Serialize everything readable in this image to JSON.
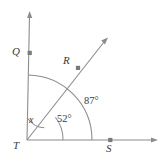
{
  "figure": {
    "background_color": "#ffffff",
    "line_color": "#8c8c8c",
    "label_color": "#3a3a3a",
    "points": [
      {
        "id": "Q",
        "label": "Q",
        "x": 30,
        "y": 53
      },
      {
        "id": "R",
        "label": "R",
        "x": 78,
        "y": 68
      },
      {
        "id": "T",
        "label": "T",
        "x": 27,
        "y": 140
      },
      {
        "id": "S",
        "label": "S",
        "x": 110,
        "y": 140
      }
    ],
    "rays": [
      {
        "id": "TQ",
        "from": "T",
        "through": "Q",
        "direction": "up",
        "arrow": true
      },
      {
        "id": "TR",
        "from": "T",
        "through": "R",
        "direction": "up-right",
        "arrow": true
      },
      {
        "id": "TS",
        "from": "T",
        "through": "S",
        "direction": "right",
        "arrow": true
      }
    ],
    "angles": [
      {
        "id": "x",
        "label": "x",
        "between": "TQ and TR",
        "value_unknown": true
      },
      {
        "id": "a52",
        "label": "52°",
        "between": "TR and TS",
        "measure": 52,
        "unit": "degrees"
      },
      {
        "id": "a87",
        "label": "87°",
        "between": "TQ and TS",
        "measure": 87,
        "unit": "degrees"
      }
    ],
    "arcs": [
      {
        "id": "arc-x",
        "for_angle": "x",
        "radius": 22
      },
      {
        "id": "arc-52",
        "for_angle": "a52",
        "radius": 36
      },
      {
        "id": "arc-87",
        "for_angle": "a87",
        "radius": 65
      }
    ]
  }
}
